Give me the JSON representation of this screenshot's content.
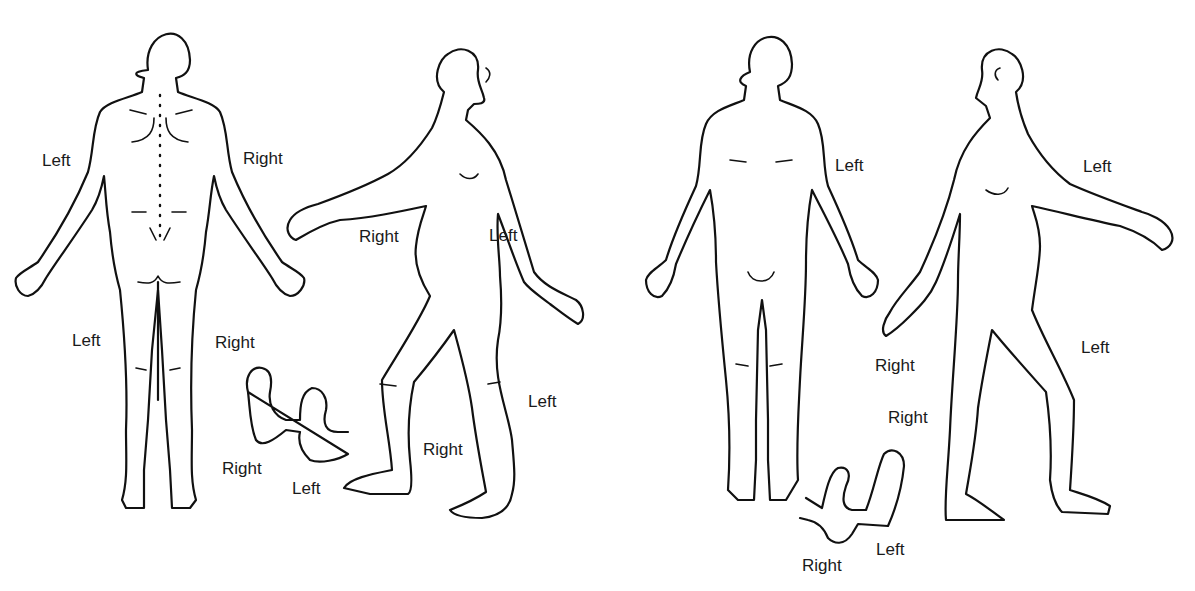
{
  "diagram": {
    "type": "body-chart",
    "figures": [
      {
        "id": "posterior",
        "view": "back"
      },
      {
        "id": "right-lateral",
        "view": "right side"
      },
      {
        "id": "anterior",
        "view": "front"
      },
      {
        "id": "left-lateral",
        "view": "left side"
      },
      {
        "id": "soles-1",
        "view": "soles of feet"
      },
      {
        "id": "soles-2",
        "view": "tops of feet"
      }
    ],
    "labels": [
      {
        "text": "Left",
        "x": 42,
        "y": 152
      },
      {
        "text": "Right",
        "x": 243,
        "y": 150
      },
      {
        "text": "Right",
        "x": 359,
        "y": 228
      },
      {
        "text": "Left",
        "x": 489,
        "y": 227
      },
      {
        "text": "Left",
        "x": 72,
        "y": 332
      },
      {
        "text": "Right",
        "x": 215,
        "y": 334
      },
      {
        "text": "Right",
        "x": 222,
        "y": 460
      },
      {
        "text": "Left",
        "x": 292,
        "y": 480
      },
      {
        "text": "Right",
        "x": 423,
        "y": 441
      },
      {
        "text": "Left",
        "x": 528,
        "y": 393
      },
      {
        "text": "Left",
        "x": 835,
        "y": 157
      },
      {
        "text": "Left",
        "x": 1083,
        "y": 158
      },
      {
        "text": "Right",
        "x": 875,
        "y": 357
      },
      {
        "text": "Right",
        "x": 888,
        "y": 409
      },
      {
        "text": "Left",
        "x": 1081,
        "y": 339
      },
      {
        "text": "Left",
        "x": 876,
        "y": 541
      },
      {
        "text": "Right",
        "x": 802,
        "y": 557
      }
    ]
  }
}
